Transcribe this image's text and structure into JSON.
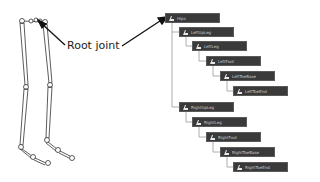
{
  "annotation": {
    "label": "Root joint"
  },
  "hierarchy": {
    "nodes": [
      {
        "label": "Hips",
        "x": 165,
        "y": 13
      },
      {
        "label": "LeftUpLeg",
        "x": 179,
        "y": 27
      },
      {
        "label": "LeftLeg",
        "x": 192,
        "y": 41
      },
      {
        "label": "LeftFoot",
        "x": 206,
        "y": 56
      },
      {
        "label": "LeftToeBase",
        "x": 220,
        "y": 71
      },
      {
        "label": "LeftToeEnd",
        "x": 233,
        "y": 86
      },
      {
        "label": "RightUpLeg",
        "x": 179,
        "y": 102
      },
      {
        "label": "RightLeg",
        "x": 192,
        "y": 117
      },
      {
        "label": "RightFoot",
        "x": 206,
        "y": 132
      },
      {
        "label": "RightToeBase",
        "x": 220,
        "y": 147
      },
      {
        "label": "RightToeEnd",
        "x": 233,
        "y": 162
      }
    ]
  },
  "colors": {
    "node_bg": "#3a3a3a",
    "connector": "#9a9a9a",
    "arrow": "#111111"
  }
}
